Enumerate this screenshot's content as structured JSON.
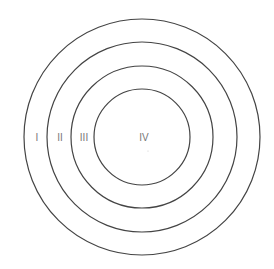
{
  "diagram": {
    "type": "concentric-circles",
    "center": [
      142,
      137
    ],
    "stroke_color": "#444444",
    "label_color": "#777777",
    "rings": [
      {
        "id": "I",
        "label": "I",
        "radius": 118,
        "label_pos": [
          37,
          137
        ]
      },
      {
        "id": "II",
        "label": "II",
        "radius": 95,
        "label_pos": [
          60,
          137
        ]
      },
      {
        "id": "III",
        "label": "III",
        "radius": 71,
        "label_pos": [
          84,
          137
        ]
      },
      {
        "id": "IV",
        "label": "IV",
        "radius": 48,
        "label_pos": [
          144,
          137
        ]
      }
    ]
  }
}
